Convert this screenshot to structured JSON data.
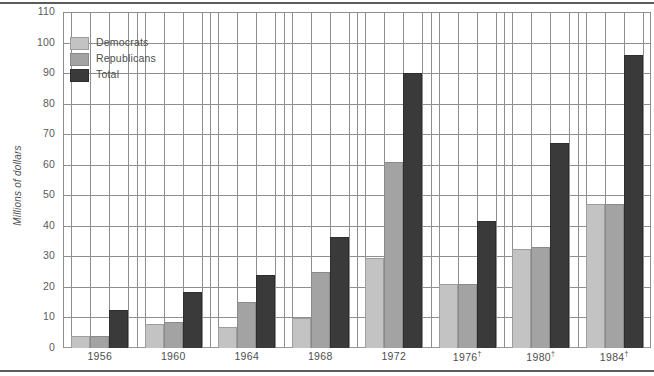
{
  "chart_data": {
    "type": "bar",
    "title": "",
    "xlabel": "",
    "ylabel": "Millions of dollars",
    "ylim": [
      0,
      110
    ],
    "ytick_step": 10,
    "yticks": [
      0,
      10,
      20,
      30,
      40,
      50,
      60,
      70,
      80,
      90,
      100,
      110
    ],
    "grid": true,
    "legend_position": "top-left",
    "categories": [
      "1956",
      "1960",
      "1964",
      "1968",
      "1972",
      "1976†",
      "1980†",
      "1984†"
    ],
    "series": [
      {
        "name": "Democrats",
        "color": "#c3c3c3",
        "values": [
          4.0,
          8.0,
          7.0,
          10.0,
          29.5,
          21.0,
          32.5,
          47.0
        ]
      },
      {
        "name": "Republicans",
        "color": "#a3a3a3",
        "values": [
          4.0,
          8.5,
          15.0,
          25.0,
          61.0,
          21.0,
          33.0,
          47.0
        ]
      },
      {
        "name": "Total",
        "color": "#3a3a3a",
        "values": [
          12.5,
          18.5,
          24.0,
          36.5,
          90.0,
          41.5,
          67.0,
          96.0
        ]
      }
    ]
  },
  "axis": {
    "y_title": "Millions of dollars"
  },
  "legend": {
    "items": [
      {
        "label": "Democrats",
        "swatch": "dem"
      },
      {
        "label": "Republicans",
        "swatch": "rep"
      },
      {
        "label": "Total",
        "swatch": "tot"
      }
    ]
  },
  "footnote_marker": "†"
}
